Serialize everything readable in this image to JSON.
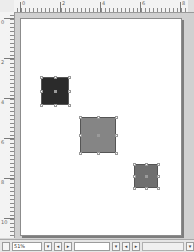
{
  "rulers": {
    "horizontal_major_ticks": [
      {
        "pos": 6,
        "label": "0"
      },
      {
        "pos": 46,
        "label": "2"
      },
      {
        "pos": 86,
        "label": "4"
      },
      {
        "pos": 126,
        "label": "6"
      },
      {
        "pos": 166,
        "label": "8"
      }
    ],
    "vertical_major_ticks": [
      {
        "pos": 6,
        "label": "0"
      },
      {
        "pos": 46,
        "label": "2"
      },
      {
        "pos": 86,
        "label": "4"
      },
      {
        "pos": 126,
        "label": "6"
      },
      {
        "pos": 166,
        "label": "8"
      },
      {
        "pos": 206,
        "label": "10"
      }
    ]
  },
  "page": {
    "background": "#ffffff",
    "shapes": [
      {
        "name": "dark-square",
        "x": 20,
        "y": 58,
        "w": 28,
        "h": 28,
        "fill": "#2b2b2b",
        "selected": true
      },
      {
        "name": "medium-square",
        "x": 59,
        "y": 98,
        "w": 36,
        "h": 36,
        "fill": "#858585",
        "selected": true
      },
      {
        "name": "small-square",
        "x": 113,
        "y": 145,
        "w": 24,
        "h": 24,
        "fill": "#6f6f6f",
        "selected": true
      }
    ]
  },
  "statusbar": {
    "zoom_value": "51%",
    "zoom_dropdown_icon": "▾",
    "page_prev_icon": "◂",
    "page_next_icon": "▸",
    "layer_dropdown_icon": "▾",
    "nav_prev_icon": "◂",
    "nav_next_icon": "▸",
    "right_dropdown_icon": "▾"
  }
}
